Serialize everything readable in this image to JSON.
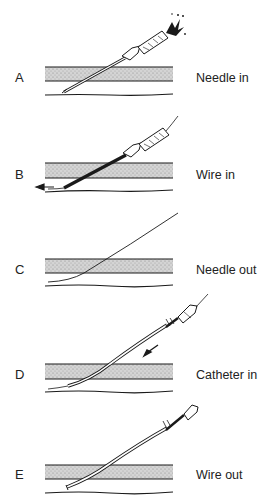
{
  "figure": {
    "topic": "Seldinger technique steps",
    "steps": [
      {
        "letter": "A",
        "caption": "Needle in"
      },
      {
        "letter": "B",
        "caption": "Wire in"
      },
      {
        "letter": "C",
        "caption": "Needle out"
      },
      {
        "letter": "D",
        "caption": "Catheter in"
      },
      {
        "letter": "E",
        "caption": "Wire out"
      }
    ]
  },
  "colors": {
    "line": "#1a1a1a",
    "vessel_fill": "#c9c9c9",
    "background": "#ffffff"
  }
}
